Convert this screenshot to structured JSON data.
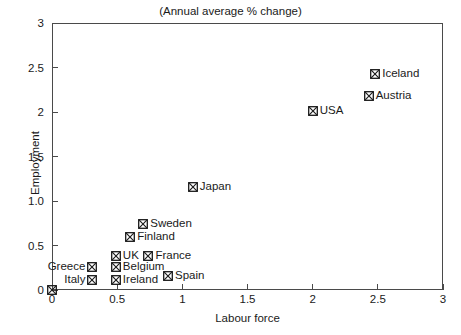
{
  "chart_data": {
    "type": "scatter",
    "title": "(Annual average % change)",
    "xlabel": "Labour force",
    "ylabel": "Employment",
    "xlim": [
      0,
      3
    ],
    "ylim": [
      0,
      3
    ],
    "grid": false,
    "legend": "none (points labelled inline)",
    "xticks": [
      "0",
      "0.5",
      "1",
      "1.5",
      "2",
      "2.5",
      "3"
    ],
    "xtick_values": [
      0,
      0.5,
      1,
      1.5,
      2,
      2.5,
      3
    ],
    "yticks": [
      "0",
      "0.5",
      "1.0",
      "1.5",
      "2",
      "2.5",
      "3"
    ],
    "ytick_values": [
      0,
      0.5,
      1.0,
      1.5,
      2,
      2.5,
      3
    ],
    "marker_style": "square-with-x",
    "points": [
      {
        "name": "Iceland",
        "x": 2.48,
        "y": 2.43,
        "label_pos": "right"
      },
      {
        "name": "Austria",
        "x": 2.43,
        "y": 2.18,
        "label_pos": "right"
      },
      {
        "name": "USA",
        "x": 2.0,
        "y": 2.01,
        "label_pos": "right"
      },
      {
        "name": "Japan",
        "x": 1.08,
        "y": 1.16,
        "label_pos": "right"
      },
      {
        "name": "Sweden",
        "x": 0.7,
        "y": 0.74,
        "label_pos": "right"
      },
      {
        "name": "Finland",
        "x": 0.6,
        "y": 0.6,
        "label_pos": "right"
      },
      {
        "name": "UK",
        "x": 0.49,
        "y": 0.38,
        "label_pos": "right"
      },
      {
        "name": "France",
        "x": 0.74,
        "y": 0.38,
        "label_pos": "right"
      },
      {
        "name": "Greece",
        "x": 0.31,
        "y": 0.26,
        "label_pos": "left"
      },
      {
        "name": "Belgium",
        "x": 0.49,
        "y": 0.26,
        "label_pos": "right"
      },
      {
        "name": "Italy",
        "x": 0.31,
        "y": 0.11,
        "label_pos": "left"
      },
      {
        "name": "Ireland",
        "x": 0.49,
        "y": 0.11,
        "label_pos": "right"
      },
      {
        "name": "Spain",
        "x": 0.89,
        "y": 0.16,
        "label_pos": "right"
      },
      {
        "name": "",
        "x": 0.0,
        "y": 0.0,
        "label_pos": "right"
      }
    ]
  },
  "colors": {
    "axis": "#4a4a4a",
    "text": "#1a1a1a",
    "marker": "#1a1a1a",
    "background": "#ffffff"
  }
}
